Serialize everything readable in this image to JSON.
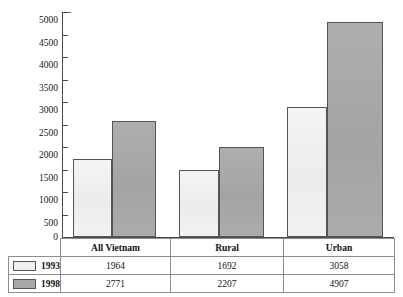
{
  "chart_data": {
    "type": "bar",
    "title": "",
    "subtitle": "",
    "xlabel": "",
    "ylabel": "",
    "categories": [
      "All Vietnam",
      "Rural",
      "Urban"
    ],
    "series": [
      {
        "name": "1993",
        "values": [
          1964,
          1692,
          3058
        ],
        "color": "#f1f1f1"
      },
      {
        "name": "1998",
        "values": [
          2771,
          2207,
          4907
        ],
        "color": "#a9a9a9"
      }
    ],
    "plotted_values": {
      "1993": [
        1730,
        1500,
        2880
      ],
      "1998": [
        2580,
        2010,
        4780
      ]
    },
    "ylim": [
      0,
      5000
    ],
    "yticks": [
      0,
      500,
      1000,
      1500,
      2000,
      2500,
      3000,
      3500,
      4000,
      4500,
      5000
    ],
    "ytick_labels": [
      "0",
      "500",
      "1000",
      "1500",
      "2000",
      "2500",
      "3000",
      "3500",
      "4000",
      "4500",
      "5000"
    ],
    "grid": false,
    "legend_position": "table-left",
    "annotations": []
  },
  "table": {
    "corner_label": "",
    "column_headers": [
      "All Vietnam",
      "Rural",
      "Urban"
    ],
    "rows": [
      {
        "series": "1993",
        "swatch": "light-swatch",
        "cells": [
          "1964",
          "1692",
          "3058"
        ]
      },
      {
        "series": "1998",
        "swatch": "gray-swatch",
        "cells": [
          "2771",
          "2207",
          "4907"
        ]
      }
    ]
  }
}
